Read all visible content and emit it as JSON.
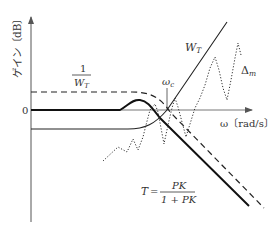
{
  "diagram": {
    "type": "bode-gain-robust-stability",
    "y_axis_label": "ゲイン〔dB〕",
    "x_axis_label": "ω〔rad/s〕",
    "zero_tick_label": "0",
    "crossover_label": {
      "main": "ω",
      "sub": "c"
    },
    "inv_weight_label": {
      "numerator": "1",
      "denominator_main": "W",
      "denominator_sub": "T"
    },
    "weight_label": {
      "main": "W",
      "sub": "T"
    },
    "uncertainty_label": {
      "main": "Δ",
      "sub": "m"
    },
    "complementary_sensitivity_label": {
      "lhs": "T",
      "eq": "=",
      "numerator": "PK",
      "denominator": "1 + PK"
    },
    "curves": [
      {
        "name": "1/W_T",
        "style": "dashed",
        "description": "flat above 0 dB, then rolls off steeply at high frequency"
      },
      {
        "name": "T",
        "style": "solid-thick",
        "description": "flat at 0 dB, small resonant peak near ω_c, then rolls off"
      },
      {
        "name": "W_T",
        "style": "solid-thin",
        "description": "flat below 0 dB, rises through 0 dB at ω_c and grows at high frequency"
      },
      {
        "name": "Δ_m",
        "style": "dotted",
        "description": "oscillating uncertainty magnitude growing with frequency"
      }
    ],
    "colors": {
      "line": "#222222",
      "axis": "#555555",
      "text": "#333333"
    }
  }
}
